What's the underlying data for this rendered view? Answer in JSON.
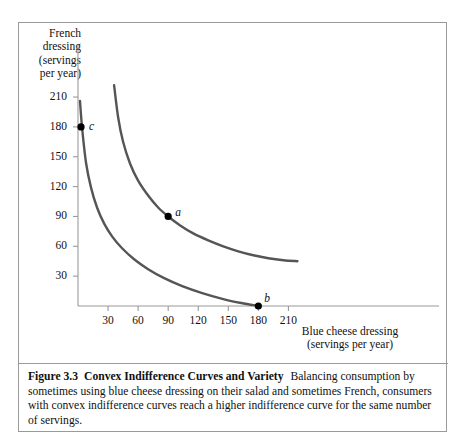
{
  "figure": {
    "caption_number": "Figure 3.3",
    "caption_title": "Convex Indifference Curves and Variety",
    "caption_text": "Balancing consumption by sometimes using blue cheese dressing on their salad and sometimes French, consumers with convex indifference curves reach a higher indifference curve for the same number of servings."
  },
  "chart_data": {
    "type": "line",
    "title": "",
    "xlabel": "Blue cheese dressing\n(servings per year)",
    "ylabel": "French\ndressing\n(servings\nper year)",
    "xlim": [
      0,
      228
    ],
    "ylim": [
      0,
      228
    ],
    "xticks": [
      30,
      60,
      90,
      120,
      150,
      180,
      210
    ],
    "yticks": [
      30,
      60,
      90,
      120,
      150,
      180,
      210
    ],
    "grid": false,
    "legend": "none",
    "curve_color": "#555555",
    "axis_color": "#9a9a9a",
    "point_color": "#000000",
    "series": [
      {
        "name": "higher-indifference-curve",
        "points": [
          [
            36,
            222
          ],
          [
            40,
            190
          ],
          [
            45,
            165
          ],
          [
            52,
            143
          ],
          [
            60,
            126
          ],
          [
            70,
            111
          ],
          [
            80,
            99
          ],
          [
            90,
            90
          ],
          [
            102,
            81
          ],
          [
            115,
            73
          ],
          [
            130,
            66
          ],
          [
            145,
            60
          ],
          [
            160,
            55
          ],
          [
            175,
            51
          ],
          [
            190,
            48
          ],
          [
            205,
            46
          ],
          [
            219,
            45
          ]
        ]
      },
      {
        "name": "lower-indifference-curve",
        "points": [
          [
            2,
            206
          ],
          [
            4,
            180
          ],
          [
            8,
            144
          ],
          [
            13,
            119
          ],
          [
            19,
            99
          ],
          [
            26,
            83
          ],
          [
            34,
            70
          ],
          [
            44,
            58
          ],
          [
            56,
            47
          ],
          [
            70,
            37
          ],
          [
            86,
            28
          ],
          [
            104,
            20
          ],
          [
            124,
            13
          ],
          [
            145,
            7
          ],
          [
            163,
            3
          ],
          [
            180,
            0
          ]
        ]
      }
    ],
    "annotations": [
      {
        "label": "a",
        "x": 90,
        "y": 90,
        "marker": true,
        "label_dx": 7,
        "label_dy": -10
      },
      {
        "label": "b",
        "x": 180,
        "y": 0,
        "marker": true,
        "label_dx": 6,
        "label_dy": -14
      },
      {
        "label": "c",
        "x": 3,
        "y": 180,
        "marker": true,
        "label_dx": 8,
        "label_dy": -7
      }
    ]
  }
}
